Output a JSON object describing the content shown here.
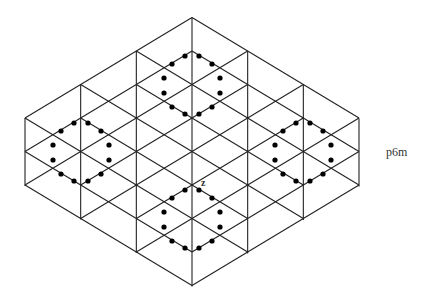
{
  "diagram": {
    "group_label": "p6m",
    "motif_label": "z",
    "colors": {
      "line": "#222222",
      "dot": "#000000",
      "background": "#ffffff"
    },
    "lattice": {
      "shape": "rhombus of equilateral triangles",
      "vertical_lines_x": [
        25,
        81,
        137,
        192,
        248,
        303,
        359
      ],
      "vertices": {
        "top": [
          192,
          18
        ],
        "bottom": [
          192,
          287
        ],
        "left_top": [
          25,
          118
        ],
        "left_bottom": [
          25,
          186
        ],
        "right_top": [
          359,
          118
        ],
        "right_bottom": [
          359,
          186
        ]
      }
    },
    "hexagon_centers_with_dots": [
      {
        "name": "top",
        "center": [
          192,
          85
        ]
      },
      {
        "name": "left",
        "center": [
          81,
          152
        ]
      },
      {
        "name": "right",
        "center": [
          303,
          152
        ]
      },
      {
        "name": "bottom",
        "center": [
          192,
          219
        ]
      }
    ],
    "dots_per_hexagon": 12
  }
}
